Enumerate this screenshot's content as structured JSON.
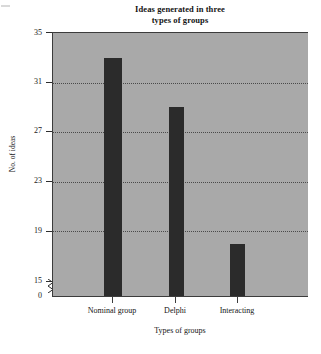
{
  "chart_data": {
    "type": "bar",
    "title": "Ideas generated in three types of groups",
    "title_line1": "Ideas generated in three",
    "title_line2": "types of groups",
    "categories": [
      "Nominal group",
      "Delphi",
      "Interacting"
    ],
    "values": [
      33,
      29,
      18
    ],
    "xlabel": "Types of groups",
    "ylabel": "No. of ideas",
    "ylim": [
      15,
      35
    ],
    "yticks": [
      "35",
      "31",
      "27",
      "23",
      "19",
      "15",
      "0"
    ],
    "ytick_values": [
      35,
      31,
      27,
      23,
      19,
      15,
      0
    ],
    "grid": true,
    "gridlines_at": [
      31,
      27,
      23,
      19
    ],
    "axis_break": true,
    "axis_break_between": [
      0,
      15
    ],
    "legend": null,
    "colors": {
      "bar": "#2b2b2b",
      "plot_background": "#a9a9a9",
      "axis": "#3c3c3c",
      "grid": "#4a4a4a",
      "text": "#141414",
      "page_background": "#ffffff"
    }
  }
}
